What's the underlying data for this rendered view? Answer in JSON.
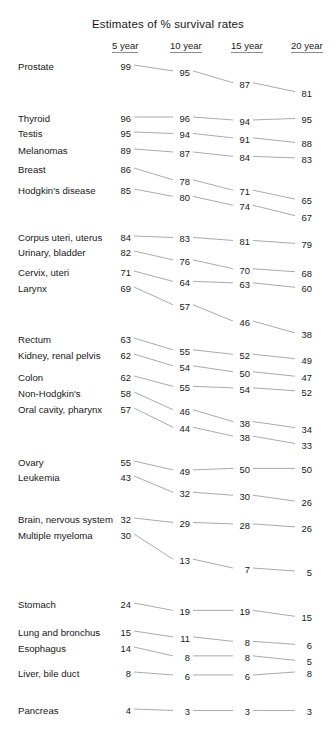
{
  "chart_data": {
    "type": "line",
    "subtype": "slopegraph",
    "title": "Estimates of % survival rates",
    "xlabel": "",
    "ylabel": "% survival",
    "categories": [
      "5 year",
      "10 year",
      "15 year",
      "20 year"
    ],
    "grid": false,
    "legend": "none",
    "ylim": [
      0,
      100
    ],
    "series": [
      {
        "name": "Prostate",
        "values": [
          99,
          95,
          87,
          81
        ]
      },
      {
        "name": "Thyroid",
        "values": [
          96,
          96,
          94,
          95
        ]
      },
      {
        "name": "Testis",
        "values": [
          95,
          94,
          91,
          88
        ]
      },
      {
        "name": "Melanomas",
        "values": [
          89,
          87,
          84,
          83
        ]
      },
      {
        "name": "Breast",
        "values": [
          86,
          78,
          71,
          65
        ]
      },
      {
        "name": "Hodgkin's disease",
        "values": [
          85,
          80,
          74,
          67
        ]
      },
      {
        "name": "Corpus uteri, uterus",
        "values": [
          84,
          83,
          81,
          79
        ]
      },
      {
        "name": "Urinary, bladder",
        "values": [
          82,
          76,
          70,
          68
        ]
      },
      {
        "name": "Cervix, uteri",
        "values": [
          71,
          64,
          63,
          60
        ]
      },
      {
        "name": "Larynx",
        "values": [
          69,
          57,
          46,
          38
        ]
      },
      {
        "name": "Rectum",
        "values": [
          63,
          55,
          52,
          49
        ]
      },
      {
        "name": "Kidney, renal pelvis",
        "values": [
          62,
          54,
          50,
          47
        ]
      },
      {
        "name": "Colon",
        "values": [
          62,
          55,
          54,
          52
        ]
      },
      {
        "name": "Non-Hodgkin's",
        "values": [
          58,
          46,
          38,
          34
        ]
      },
      {
        "name": "Oral cavity, pharynx",
        "values": [
          57,
          44,
          38,
          33
        ]
      },
      {
        "name": "Ovary",
        "values": [
          55,
          49,
          50,
          50
        ]
      },
      {
        "name": "Leukemia",
        "values": [
          43,
          32,
          30,
          26
        ]
      },
      {
        "name": "Brain, nervous system",
        "values": [
          32,
          29,
          28,
          26
        ]
      },
      {
        "name": "Multiple myeloma",
        "values": [
          30,
          13,
          7,
          5
        ]
      },
      {
        "name": "Stomach",
        "values": [
          24,
          19,
          19,
          15
        ]
      },
      {
        "name": "Lung and bronchus",
        "values": [
          15,
          11,
          8,
          6
        ]
      },
      {
        "name": "Esophagus",
        "values": [
          14,
          8,
          8,
          5
        ]
      },
      {
        "name": "Liver, bile duct",
        "values": [
          8,
          6,
          6,
          8
        ]
      },
      {
        "name": "Pancreas",
        "values": [
          4,
          3,
          3,
          3
        ]
      }
    ]
  },
  "header": {
    "title": "Estimates of % survival rates",
    "columns": [
      "5 year",
      "10 year",
      "15 year",
      "20 year"
    ]
  },
  "colors": {
    "text": "#181818",
    "line": "#8e8e8e",
    "rule": "#8c8c8c",
    "background": "#ffffff"
  }
}
